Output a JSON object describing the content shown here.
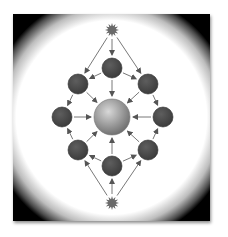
{
  "diagram": {
    "type": "network-flow",
    "frame": {
      "background": "#ffffff",
      "vignette": "#000000"
    },
    "colors": {
      "node_fill": "#4a4a4a",
      "node_stroke": "#2e2e2e",
      "center_light": "#d8d8d8",
      "center_dark": "#6a6a6a",
      "star_fill": "#6a6a6a",
      "arrow": "#555555"
    },
    "nodes": [
      {
        "id": "star-top",
        "kind": "star",
        "x": 112,
        "y": 30,
        "r": 7
      },
      {
        "id": "n-top",
        "kind": "node",
        "x": 112,
        "y": 68,
        "r": 10
      },
      {
        "id": "n-upper-left",
        "kind": "node",
        "x": 78,
        "y": 84,
        "r": 10
      },
      {
        "id": "n-upper-right",
        "kind": "node",
        "x": 148,
        "y": 84,
        "r": 10
      },
      {
        "id": "n-left",
        "kind": "node",
        "x": 62,
        "y": 117,
        "r": 10
      },
      {
        "id": "center",
        "kind": "hub",
        "x": 112,
        "y": 117,
        "r": 18
      },
      {
        "id": "n-right",
        "kind": "node",
        "x": 163,
        "y": 117,
        "r": 10
      },
      {
        "id": "n-lower-left",
        "kind": "node",
        "x": 78,
        "y": 150,
        "r": 10
      },
      {
        "id": "n-lower-right",
        "kind": "node",
        "x": 148,
        "y": 150,
        "r": 10
      },
      {
        "id": "n-bottom",
        "kind": "node",
        "x": 112,
        "y": 166,
        "r": 10
      },
      {
        "id": "star-bottom",
        "kind": "star",
        "x": 112,
        "y": 203,
        "r": 7
      }
    ],
    "edges": [
      {
        "from": "star-top",
        "to": "n-top"
      },
      {
        "from": "star-top",
        "to": "n-upper-left"
      },
      {
        "from": "star-top",
        "to": "n-upper-right"
      },
      {
        "from": "n-top",
        "to": "n-upper-left"
      },
      {
        "from": "n-top",
        "to": "n-upper-right"
      },
      {
        "from": "n-top",
        "to": "center"
      },
      {
        "from": "n-upper-left",
        "to": "n-left"
      },
      {
        "from": "n-upper-left",
        "to": "center"
      },
      {
        "from": "n-upper-right",
        "to": "n-right"
      },
      {
        "from": "n-upper-right",
        "to": "center"
      },
      {
        "from": "n-left",
        "to": "center"
      },
      {
        "from": "n-right",
        "to": "center"
      },
      {
        "from": "n-lower-left",
        "to": "n-left"
      },
      {
        "from": "n-lower-left",
        "to": "center"
      },
      {
        "from": "n-lower-right",
        "to": "n-right"
      },
      {
        "from": "n-lower-right",
        "to": "center"
      },
      {
        "from": "n-bottom",
        "to": "center"
      },
      {
        "from": "n-bottom",
        "to": "n-lower-left"
      },
      {
        "from": "n-bottom",
        "to": "n-lower-right"
      },
      {
        "from": "star-bottom",
        "to": "n-bottom"
      },
      {
        "from": "star-bottom",
        "to": "n-lower-left"
      },
      {
        "from": "star-bottom",
        "to": "n-lower-right"
      }
    ]
  }
}
